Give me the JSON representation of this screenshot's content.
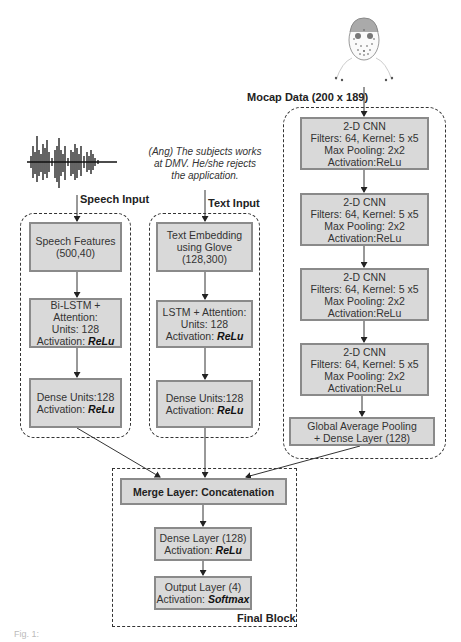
{
  "inputs": {
    "speech_label": "Speech Input",
    "text_label": "Text Input",
    "mocap_label": "Mocap Data (200 x 189)",
    "text_sample_line1": "(Ang)  The subjects works",
    "text_sample_line2": "at DMV. He/she rejects",
    "text_sample_line3": "the application.",
    "speech_icon": "waveform-icon",
    "mocap_icon": "face-markers-icon"
  },
  "speech_branch": {
    "features": {
      "line1": "Speech Features",
      "line2": "(500,40)"
    },
    "bilstm": {
      "line1": "Bi-LSTM + Attention:",
      "line2": "Units: 128",
      "line3_prefix": "Activation: ",
      "line3_em": "ReLu"
    },
    "dense": {
      "line1": "Dense  Units:128",
      "line2_prefix": "Activation: ",
      "line2_em": "ReLu"
    }
  },
  "text_branch": {
    "embedding": {
      "line1": "Text  Embedding",
      "line2": "using Glove",
      "line3": "(128,300)"
    },
    "lstm": {
      "line1": "LSTM + Attention:",
      "line2": "Units: 128",
      "line3_prefix": "Activation: ",
      "line3_em": "ReLu"
    },
    "dense": {
      "line1": "Dense  Units:128",
      "line2_prefix": "Activation: ",
      "line2_em": "ReLu"
    }
  },
  "mocap_branch": {
    "cnn_blocks": [
      {
        "title": "2-D CNN",
        "filters": "Filters:  64, Kernel: 5 x5",
        "pooling": "Max Pooling: 2x2",
        "activation": "Activation:ReLu"
      },
      {
        "title": "2-D CNN",
        "filters": "Filters:  64, Kernel: 5 x5",
        "pooling": "Max Pooling: 2x2",
        "activation": "Activation:ReLu"
      },
      {
        "title": "2-D CNN",
        "filters": "Filters:  64, Kernel: 5 x5",
        "pooling": "Max Pooling: 2x2",
        "activation": "Activation:ReLu"
      },
      {
        "title": "2-D CNN",
        "filters": "Filters:  64, Kernel: 5 x5",
        "pooling": "Max Pooling: 2x2",
        "activation": "Activation:ReLu"
      }
    ],
    "gap": {
      "line1": "Global Average Pooling",
      "line2": "+ Dense Layer (128)"
    }
  },
  "final_block": {
    "label": "Final Block",
    "merge": "Merge  Layer:  Concatenation",
    "dense": {
      "line1": "Dense  Layer (128)",
      "line2_prefix": "Activation: ",
      "line2_em": "ReLu"
    },
    "output": {
      "line1": "Output Layer (4)",
      "line2_prefix": "Activation: ",
      "line2_em": "Softmax"
    }
  },
  "caption": "Fig. 1:",
  "colors": {
    "box_fill": "#d9d9d9",
    "box_border": "#8a8a8a",
    "line": "#333333"
  }
}
